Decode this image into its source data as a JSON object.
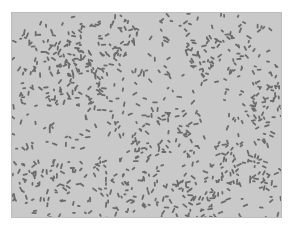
{
  "image": {
    "subject": "micrograph of rod-shaped bacteria",
    "background_color": "#c9c9c9",
    "cell_color": "#6b6b6b",
    "frame": {
      "x": 11,
      "y": 12,
      "width": 271,
      "height": 206
    }
  }
}
